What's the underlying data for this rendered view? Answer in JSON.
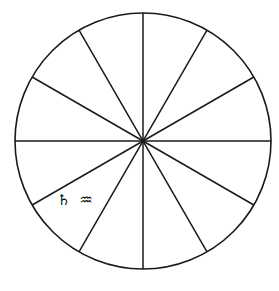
{
  "figure": {
    "name": "twelve-sector-circle-diagram",
    "background_color": "#ffffff",
    "stroke_color": "#1a1a1a"
  },
  "circle": {
    "center_x": 143,
    "center_y": 141,
    "radius": 128,
    "stroke_width": 1.6
  },
  "spokes": {
    "count": 12,
    "sector_angle_degrees": 30,
    "diameter_count": 6,
    "diameter_angles_degrees": [
      0,
      30,
      60,
      90,
      120,
      150
    ],
    "spoke_angles_degrees": [
      0,
      30,
      60,
      90,
      120,
      150,
      180,
      210,
      240,
      270,
      300,
      330
    ]
  },
  "labels": [
    {
      "id": "sector-label-saturn-aquarius",
      "glyphs": "♄ ♒",
      "saturn_symbol": "♄",
      "aquarius_symbol": "♒",
      "saturn_name": "Saturn",
      "aquarius_name": "Aquarius",
      "sector_index": 6,
      "sector_start_degrees": 180,
      "sector_end_degrees": 210,
      "x": 57,
      "y": 200
    }
  ]
}
